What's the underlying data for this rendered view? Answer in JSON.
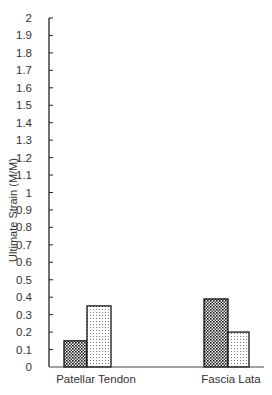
{
  "chart_data": {
    "type": "bar",
    "title": "",
    "xlabel": "",
    "ylabel": "Ultimate Strain (M/M)",
    "ylim": [
      0,
      2
    ],
    "yticks": [
      "0",
      "0.1",
      "0.2",
      "0.3",
      "0.4",
      "0.5",
      "0.6",
      "0.7",
      "0.8",
      "0.9",
      "1",
      "1.1",
      "1.2",
      "1.3",
      "1.4",
      "1.5",
      "1.6",
      "1.7",
      "1.8",
      "1.9",
      "2"
    ],
    "categories": [
      "Patellar Tendon",
      "Fascia Lata"
    ],
    "series": [
      {
        "name": "Series 1 (dense hatch)",
        "values": [
          0.15,
          0.39
        ]
      },
      {
        "name": "Series 2 (light dots)",
        "values": [
          0.35,
          0.2
        ]
      }
    ],
    "grid": false,
    "legend": "none"
  }
}
